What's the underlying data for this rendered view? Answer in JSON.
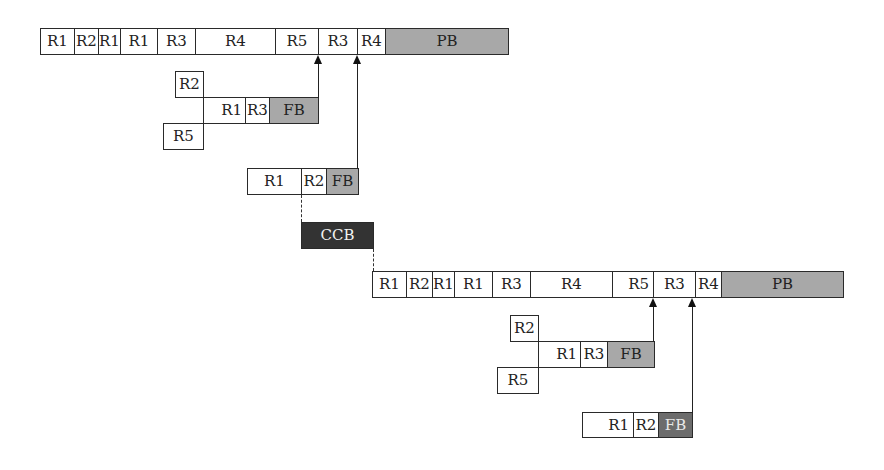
{
  "diagram": {
    "title": "",
    "chains": {
      "top_critical": [
        {
          "label": "R1",
          "x": 40,
          "w": 34
        },
        {
          "label": "R2",
          "x": 74,
          "w": 24
        },
        {
          "label": "R1",
          "x": 98,
          "w": 22
        },
        {
          "label": "R1",
          "x": 120,
          "w": 37
        },
        {
          "label": "R3",
          "x": 157,
          "w": 38
        },
        {
          "label": "R4",
          "x": 195,
          "w": 80
        },
        {
          "label": "R5",
          "x": 275,
          "w": 43
        },
        {
          "label": "R3",
          "x": 318,
          "w": 39
        },
        {
          "label": "R4",
          "x": 357,
          "w": 28
        },
        {
          "label": "PB",
          "x": 385,
          "w": 124,
          "type": "project-buffer"
        }
      ],
      "top_feeding_1": {
        "r2": {
          "label": "R2"
        },
        "r5": {
          "label": "R5"
        },
        "items": [
          {
            "label": "R1"
          },
          {
            "label": "R3"
          },
          {
            "label": "FB",
            "type": "feeding-buffer"
          }
        ]
      },
      "top_feeding_2": {
        "items": [
          {
            "label": "R1"
          },
          {
            "label": "R2"
          },
          {
            "label": "FB",
            "type": "feeding-buffer"
          }
        ]
      },
      "ccb": {
        "label": "CCB",
        "type": "capacity-constraint-buffer"
      },
      "bottom_critical": [
        {
          "label": "R1"
        },
        {
          "label": "R2"
        },
        {
          "label": "R1"
        },
        {
          "label": "R1"
        },
        {
          "label": "R3"
        },
        {
          "label": "R4"
        },
        {
          "label": "R5"
        },
        {
          "label": "R3"
        },
        {
          "label": "R4"
        },
        {
          "label": "PB",
          "type": "project-buffer"
        }
      ],
      "bottom_feeding_1": {
        "r2": {
          "label": "R2"
        },
        "r5": {
          "label": "R5"
        },
        "items": [
          {
            "label": "R1"
          },
          {
            "label": "R3"
          },
          {
            "label": "FB",
            "type": "feeding-buffer"
          }
        ]
      },
      "bottom_feeding_2": {
        "items": [
          {
            "label": "R1"
          },
          {
            "label": "R2"
          },
          {
            "label": "FB",
            "type": "feeding-buffer-dark"
          }
        ]
      }
    },
    "colors": {
      "buffer": "#a8a8a8",
      "buffer_dark": "#6c6c6c",
      "ccb": "#333333",
      "border": "#2a2a2a"
    }
  }
}
